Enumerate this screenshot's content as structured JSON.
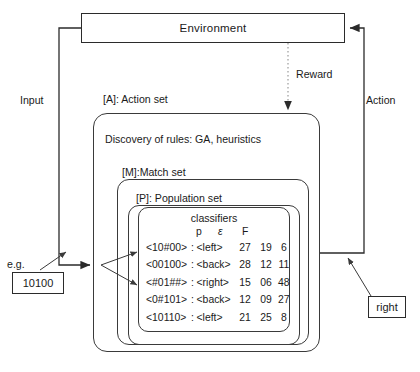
{
  "diagram": {
    "title_blocks": {
      "environment": "Environment",
      "action_set": "[A]: Action set",
      "match_set": "[M]:Match set",
      "population_set": "[P]: Population set",
      "classifiers": "classifiers",
      "discovery": "Discovery of rules: GA, heuristics"
    },
    "edge_labels": {
      "input": "Input",
      "action": "Action",
      "reward": "Reward",
      "example": "e.g."
    },
    "io_examples": {
      "input_value": "10100",
      "output_value": "right"
    },
    "table": {
      "columns": [
        "p",
        "ε",
        "F"
      ],
      "rows": [
        {
          "condition": "<10#00>",
          "sep": ":",
          "action": "<left>",
          "p": "27",
          "e": "19",
          "f": "6"
        },
        {
          "condition": "<00100>",
          "sep": ":",
          "action": "<back>",
          "p": "28",
          "e": "12",
          "f": "11"
        },
        {
          "condition": "<#01##>",
          "sep": ":",
          "action": "<right>",
          "p": "15",
          "e": "06",
          "f": "48"
        },
        {
          "condition": "<0#101>",
          "sep": ":",
          "action": "<back>",
          "p": "12",
          "e": "09",
          "f": "27"
        },
        {
          "condition": "<10110>",
          "sep": ":",
          "action": "<left>",
          "p": "21",
          "e": "25",
          "f": "8"
        }
      ]
    },
    "colors": {
      "stroke": "#2b2b2b",
      "dotted_stroke": "#9a9a9a",
      "background": "#ffffff"
    }
  }
}
